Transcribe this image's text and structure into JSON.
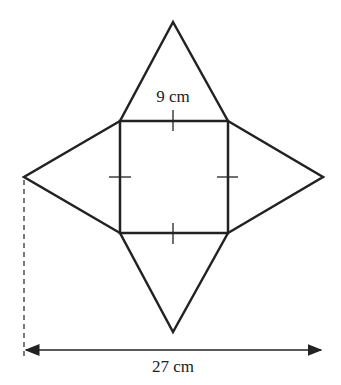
{
  "diagram": {
    "type": "net of square-based pyramid",
    "labels": {
      "side": "9 cm",
      "total_width": "27 cm"
    },
    "colors": {
      "stroke": "#222222",
      "background": "#ffffff"
    }
  }
}
